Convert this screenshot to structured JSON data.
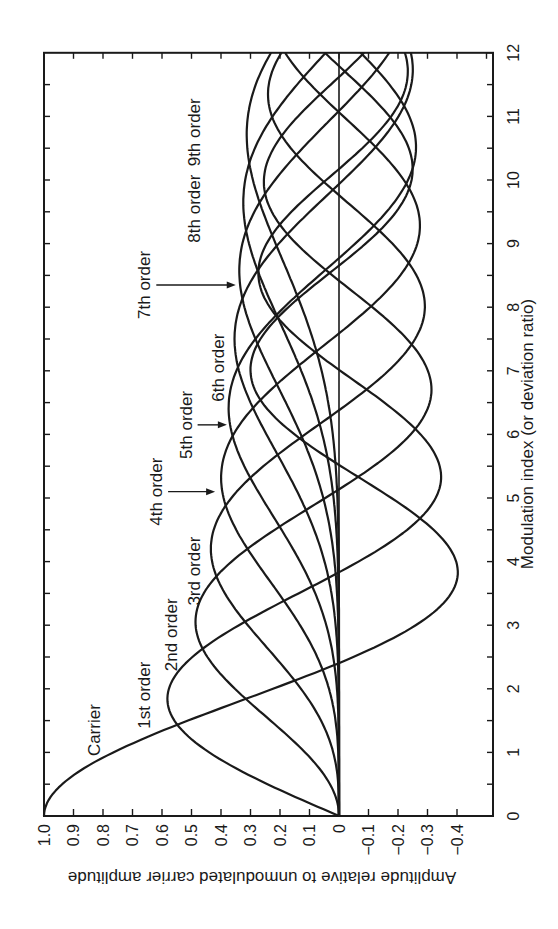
{
  "chart_data": {
    "type": "line",
    "orientation": "rotated-90-ccw",
    "title": "",
    "xlabel": "Modulation index (or deviation ratio)",
    "ylabel": "Amplitude relative to unmodulated carrier amplitude",
    "xlim": [
      0,
      12
    ],
    "ylim": [
      -0.5,
      1.0
    ],
    "x_ticks": [
      "0",
      "1",
      "2",
      "3",
      "4",
      "5",
      "6",
      "7",
      "8",
      "9",
      "10",
      "11",
      "12"
    ],
    "y_ticks": [
      "1.0",
      "0.9",
      "0.8",
      "0.7",
      "0.6",
      "0.5",
      "0.4",
      "0.3",
      "0.2",
      "0.1",
      "0",
      "−0.1",
      "−0.2",
      "−0.3",
      "−0.4"
    ],
    "y_tick_values": [
      1.0,
      0.9,
      0.8,
      0.7,
      0.6,
      0.5,
      0.4,
      0.3,
      0.2,
      0.1,
      0,
      -0.1,
      -0.2,
      -0.3,
      -0.4
    ],
    "grid": false,
    "legend": "inline labels",
    "x": [
      0,
      1,
      2,
      3,
      4,
      5,
      6,
      7,
      8,
      9,
      10,
      11,
      12
    ],
    "series": [
      {
        "name": "Carrier",
        "order": 0,
        "values": [
          1.0,
          0.7652,
          0.2239,
          -0.2601,
          -0.3971,
          -0.1776,
          0.1506,
          0.3001,
          0.1717,
          -0.0903,
          -0.2459,
          -0.1712,
          0.0477
        ]
      },
      {
        "name": "1st order",
        "order": 1,
        "values": [
          0,
          0.4401,
          0.5767,
          0.3391,
          -0.066,
          -0.3276,
          -0.2767,
          -0.0047,
          0.2346,
          0.2453,
          0.0435,
          -0.1768,
          -0.2234
        ]
      },
      {
        "name": "2nd order",
        "order": 2,
        "values": [
          0,
          0.1149,
          0.3528,
          0.4861,
          0.3641,
          0.0466,
          -0.2429,
          -0.3014,
          -0.113,
          0.1448,
          0.2546,
          0.139,
          -0.0849
        ]
      },
      {
        "name": "3rd order",
        "order": 3,
        "values": [
          0,
          0.0196,
          0.1289,
          0.3091,
          0.4302,
          0.3648,
          0.1148,
          -0.1676,
          -0.2911,
          -0.1809,
          0.0584,
          0.2273,
          0.1951
        ]
      },
      {
        "name": "4th order",
        "order": 4,
        "values": [
          0,
          0.0025,
          0.034,
          0.132,
          0.2811,
          0.3912,
          0.3576,
          0.1578,
          -0.1054,
          -0.2655,
          -0.2196,
          -0.015,
          0.1825
        ]
      },
      {
        "name": "5th order",
        "order": 5,
        "values": [
          0,
          0.0002,
          0.007,
          0.043,
          0.1321,
          0.2611,
          0.3621,
          0.3479,
          0.1858,
          -0.055,
          -0.2341,
          -0.2383,
          -0.0735
        ]
      },
      {
        "name": "6th order",
        "order": 6,
        "values": [
          0,
          0.0,
          0.0012,
          0.0114,
          0.0491,
          0.131,
          0.2458,
          0.3392,
          0.3376,
          0.2043,
          -0.0145,
          -0.2016,
          -0.2437
        ]
      },
      {
        "name": "7th order",
        "order": 7,
        "values": [
          0,
          0,
          0.0002,
          0.0025,
          0.0152,
          0.0534,
          0.1296,
          0.2336,
          0.3206,
          0.3275,
          0.2167,
          0.0184,
          -0.1703
        ]
      },
      {
        "name": "8th order",
        "order": 8,
        "values": [
          0,
          0,
          0,
          0.0005,
          0.004,
          0.0184,
          0.0565,
          0.128,
          0.2235,
          0.3051,
          0.3179,
          0.225,
          0.0451
        ]
      },
      {
        "name": "9th order",
        "order": 9,
        "values": [
          0,
          0,
          0,
          0.0001,
          0.0009,
          0.0055,
          0.0212,
          0.0589,
          0.1263,
          0.2149,
          0.2919,
          0.3089,
          0.2304
        ]
      }
    ],
    "annotations": [
      {
        "text": "Carrier",
        "x": 1.35,
        "y": 0.83,
        "arrow": false
      },
      {
        "text": "1st order",
        "x": 1.9,
        "y": 0.66,
        "arrow": false
      },
      {
        "text": "2nd order",
        "x": 2.85,
        "y": 0.57,
        "arrow": false
      },
      {
        "text": "3rd order",
        "x": 3.85,
        "y": 0.49,
        "arrow": false
      },
      {
        "text": "4th order",
        "x": 5.1,
        "y": 0.62,
        "arrow": true,
        "arrow_to": 0.42
      },
      {
        "text": "5th order",
        "x": 6.15,
        "y": 0.52,
        "arrow": true,
        "arrow_to": 0.38
      },
      {
        "text": "6th order",
        "x": 7.05,
        "y": 0.41,
        "arrow": false
      },
      {
        "text": "7th order",
        "x": 8.35,
        "y": 0.66,
        "arrow": true,
        "arrow_to": 0.35
      },
      {
        "text": "8th order",
        "x": 9.55,
        "y": 0.49,
        "arrow": false
      },
      {
        "text": "9th order",
        "x": 10.75,
        "y": 0.49,
        "arrow": false
      }
    ]
  }
}
